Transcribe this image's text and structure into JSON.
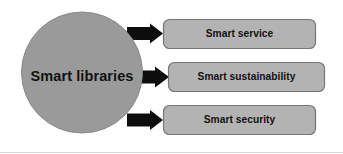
{
  "diagram": {
    "type": "hub-and-spoke",
    "background_color": "#ffffff",
    "hub": {
      "label": "Smart libraries",
      "shape": "circle",
      "fill_color": "#9a9a9a",
      "stroke_color": "#8c8c8c",
      "text_color": "#121212"
    },
    "connector": {
      "shape": "block-arrow",
      "color": "#0d0d0d",
      "direction": "right",
      "count": 3
    },
    "nodes": [
      {
        "label": "Smart service",
        "shape": "rounded-rectangle",
        "fill_color": "#b3b3b3",
        "stroke_color": "#767676",
        "text_color": "#111111"
      },
      {
        "label": "Smart sustainability",
        "shape": "rounded-rectangle",
        "fill_color": "#b3b3b3",
        "stroke_color": "#767676",
        "text_color": "#111111"
      },
      {
        "label": "Smart security",
        "shape": "rounded-rectangle",
        "fill_color": "#b3b3b3",
        "stroke_color": "#767676",
        "text_color": "#111111"
      }
    ],
    "baseline_rule_color": "#d9d9d9"
  }
}
